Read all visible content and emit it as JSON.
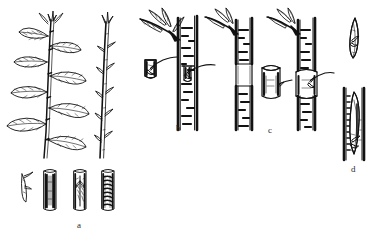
{
  "figure": {
    "title": "",
    "caption": "",
    "type": "botanical-line-drawing",
    "ink_color": "#111111",
    "background_color": "#ffffff",
    "panels": [
      {
        "key": "a",
        "label": "a",
        "label_x": 77,
        "label_y": 225,
        "description": "Leafy budstick shoot with leaves, a defoliated budstick, a detached bud chip and three stem segments showing plain bark, a cut incision and a wrapped/bound union",
        "items": [
          {
            "name": "leafy-budstick",
            "description": "upright shoot with seven elliptical leaves on alternate petioles"
          },
          {
            "name": "defoliated-budstick",
            "description": "slender stem with leaf scars and dormant buds, leaves removed"
          },
          {
            "name": "detached-bud-chip",
            "description": "small sliver of bark bearing a single bud"
          },
          {
            "name": "stem-segment-plain",
            "description": "short cut stem section with lenticelled bark"
          },
          {
            "name": "stem-segment-incised",
            "description": "stem section with vertical bark incision and lifted flaps"
          },
          {
            "name": "stem-segment-wrapped",
            "description": "stem section bound with spiral tying material"
          }
        ]
      },
      {
        "key": "b",
        "label": "b",
        "label_x": 177,
        "label_y": 128,
        "description": "Shield (T) budding: a detached bud shield at left and the same shield inserted beneath the bark of a rootstock stem carrying a leafy lateral shoot",
        "items": [
          {
            "name": "detached-bud-shield",
            "description": "rectangular bark shield with a bud and stub of petiole"
          },
          {
            "name": "rootstock-stem-with-shield",
            "description": "vertical stem with T-cut receiving the bud shield"
          },
          {
            "name": "lateral-leafy-shoot",
            "description": "side shoot with narrow leaves at top of rootstock"
          }
        ]
      },
      {
        "key": "c",
        "label": "c",
        "label_x": 269,
        "label_y": 130,
        "description": "Ring / patch budding: stem with a complete ring of bark removed, the detached bark cylinder bearing a bud, and the ring fitted onto the stem",
        "items": [
          {
            "name": "stem-with-bark-ring-removed",
            "description": "vertical stem showing exposed white band where bark ring was taken"
          },
          {
            "name": "detached-bark-cylinder",
            "description": "short open ring of bark carrying a bud"
          },
          {
            "name": "stem-with-ring-fitted",
            "description": "stem with the bud-bearing bark ring seated in place"
          },
          {
            "name": "lateral-leafy-shoot",
            "description": "side shoot with narrow leaves at top of each stem"
          }
        ]
      },
      {
        "key": "d",
        "label": "d",
        "label_x": 352,
        "label_y": 169,
        "description": "Chip budding: a detached bud chip above, and a stem into which the chip has been set",
        "items": [
          {
            "name": "detached-bud-chip",
            "description": "slender wedge of wood and bark with a single bud"
          },
          {
            "name": "stem-with-chip-inserted",
            "description": "stem segment with the chip seated in a matching notch"
          }
        ]
      }
    ]
  }
}
